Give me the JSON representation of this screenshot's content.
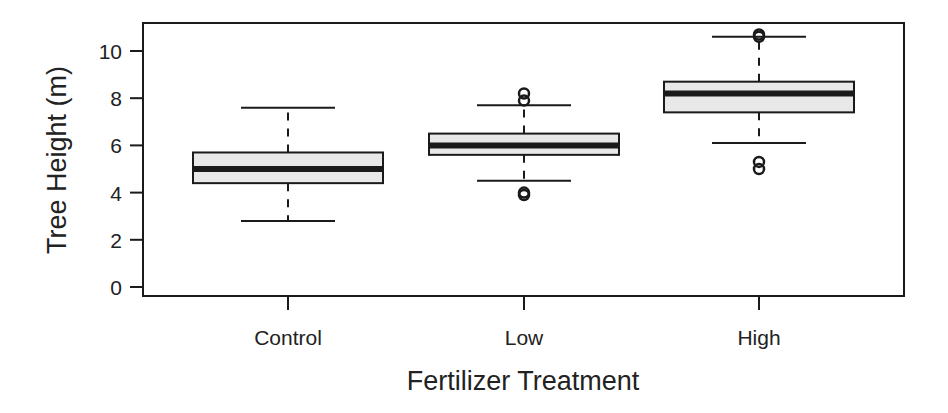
{
  "chart_data": {
    "type": "box",
    "title": "",
    "xlabel": "Fertilizer Treatment",
    "ylabel": "Tree Height (m)",
    "ylim": [
      0,
      10.8
    ],
    "yticks": [
      0,
      2,
      4,
      6,
      8,
      10
    ],
    "categories": [
      "Control",
      "Low",
      "High"
    ],
    "grid": false,
    "legend": null,
    "box_fill": "#e8e8e8",
    "line_color": "#1a1a1a",
    "series": [
      {
        "name": "Control",
        "whisker_low": 2.8,
        "q1": 4.4,
        "median": 5.0,
        "q3": 5.7,
        "whisker_high": 7.6,
        "outliers": []
      },
      {
        "name": "Low",
        "whisker_low": 4.5,
        "q1": 5.6,
        "median": 6.0,
        "q3": 6.5,
        "whisker_high": 7.7,
        "outliers": [
          3.9,
          4.0,
          7.9,
          8.2
        ]
      },
      {
        "name": "High",
        "whisker_low": 6.1,
        "q1": 7.4,
        "median": 8.2,
        "q3": 8.7,
        "whisker_high": 10.6,
        "outliers": [
          5.0,
          5.3,
          10.6,
          10.7
        ]
      }
    ]
  }
}
